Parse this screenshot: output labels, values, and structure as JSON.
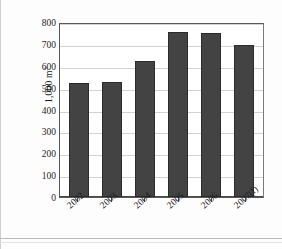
{
  "chart_data": {
    "type": "bar",
    "title": "",
    "xlabel": "",
    "ylabel": "1,000 m",
    "ylabel_superscript": "3",
    "categories": [
      "2002",
      "2003",
      "2004",
      "2005",
      "2006",
      "2007(f)"
    ],
    "values": [
      520,
      525,
      620,
      755,
      750,
      695
    ],
    "ylim": [
      0,
      800
    ],
    "ytick_labels": [
      "800",
      "700",
      "600",
      "500",
      "400",
      "300",
      "200",
      "100",
      "0"
    ],
    "ytick_values": [
      800,
      700,
      600,
      500,
      400,
      300,
      200,
      100,
      0
    ],
    "grid": true,
    "grid_axis": "y",
    "legend": false,
    "legend_position": "none",
    "series": [
      {
        "name": "Volume",
        "values": [
          520,
          525,
          620,
          755,
          750,
          695
        ]
      }
    ],
    "bar_color": "#434343",
    "plot_border_color": "#595959",
    "gridline_color": "#d2d2d2",
    "background_color": "#ffffff"
  }
}
